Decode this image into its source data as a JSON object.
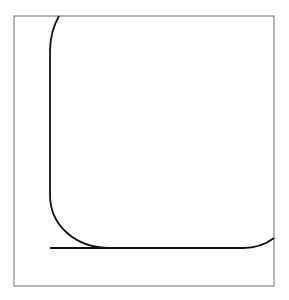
{
  "diagram": {
    "type": "line-drawing",
    "frame": {
      "x": 14,
      "y": 16,
      "width": 260,
      "height": 270,
      "stroke": "#888888"
    },
    "curve": {
      "stroke": "#111111",
      "path": "M 59 16 C 52 28 50 38 50 52 L 50 195 C 50 225 75 248 110 248 L 243 248 C 255 248 265 245 274 238"
    },
    "baseline": {
      "x1": 50,
      "y1": 248,
      "x2": 112,
      "y2": 248,
      "stroke": "#111111"
    }
  }
}
